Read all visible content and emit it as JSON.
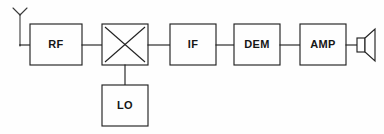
{
  "diagram": {
    "colors": {
      "background": "#fefefe",
      "stroke": "#222222",
      "label": "#161616",
      "antenna": "#3a3a3a"
    },
    "blocks": [
      {
        "id": "rf",
        "label": "RF",
        "x": 30,
        "y": 24,
        "w": 52,
        "h": 41
      },
      {
        "id": "mixer",
        "label": "",
        "x": 102,
        "y": 24,
        "w": 46,
        "h": 41
      },
      {
        "id": "if",
        "label": "IF",
        "x": 170,
        "y": 24,
        "w": 46,
        "h": 41
      },
      {
        "id": "dem",
        "label": "DEM",
        "x": 234,
        "y": 24,
        "w": 46,
        "h": 41
      },
      {
        "id": "amp",
        "label": "AMP",
        "x": 300,
        "y": 24,
        "w": 46,
        "h": 41
      },
      {
        "id": "lo",
        "label": "LO",
        "x": 102,
        "y": 85,
        "w": 46,
        "h": 41
      }
    ],
    "symbols": {
      "antenna": "antenna-icon",
      "mixer": "mixer-x-icon",
      "speaker": "speaker-icon"
    },
    "connections": [
      {
        "from": "antenna",
        "to": "rf"
      },
      {
        "from": "rf",
        "to": "mixer"
      },
      {
        "from": "mixer",
        "to": "if"
      },
      {
        "from": "if",
        "to": "dem"
      },
      {
        "from": "dem",
        "to": "amp"
      },
      {
        "from": "amp",
        "to": "speaker"
      },
      {
        "from": "lo",
        "to": "mixer"
      }
    ]
  }
}
